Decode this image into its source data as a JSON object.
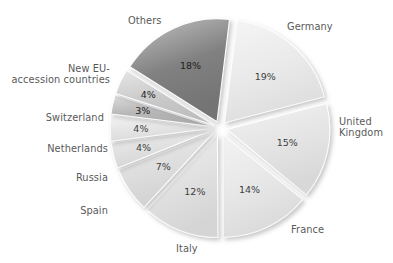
{
  "chart_data": {
    "type": "pie",
    "title": "",
    "xlabel": "",
    "ylabel": "",
    "units": "percent",
    "legend_position": "callout-labels",
    "grid": false,
    "exploded": true,
    "start_angle_deg": -83,
    "categories": [
      "Germany",
      "United Kingdom",
      "France",
      "Italy",
      "Spain",
      "Russia",
      "Netherlands",
      "Switzerland",
      "New EU-accession countries",
      "Others"
    ],
    "values": [
      19,
      15,
      14,
      12,
      7,
      4,
      4,
      3,
      4,
      18
    ],
    "value_labels": [
      "19%",
      "15%",
      "14%",
      "12%",
      "7%",
      "4%",
      "4%",
      "3%",
      "4%",
      "18%"
    ],
    "slice_colors": [
      "#e9e9e9",
      "#e3e3e3",
      "#e6e6e6",
      "#e0e0e0",
      "#dcdcdc",
      "#dfdfdf",
      "#e4e4e4",
      "#b5b5b5",
      "#c8c8c8",
      "#7a7a7a"
    ]
  },
  "slices": [
    {
      "id": "germany",
      "name": "Germany",
      "label_lines": [
        "Germany"
      ],
      "value_label": "19%",
      "value": 19,
      "color": "#e9e9e9",
      "dark_text": false,
      "label_pos": {
        "left": 287,
        "top": 21,
        "align": "left"
      }
    },
    {
      "id": "united-kingdom",
      "name": "United Kingdom",
      "label_lines": [
        "United",
        "Kingdom"
      ],
      "value_label": "15%",
      "value": 15,
      "color": "#e3e3e3",
      "dark_text": false,
      "label_pos": {
        "left": 339,
        "top": 116,
        "align": "left"
      }
    },
    {
      "id": "france",
      "name": "France",
      "label_lines": [
        "France"
      ],
      "value_label": "14%",
      "value": 14,
      "color": "#e6e6e6",
      "dark_text": false,
      "label_pos": {
        "left": 291,
        "top": 224,
        "align": "left"
      }
    },
    {
      "id": "italy",
      "name": "Italy",
      "label_lines": [
        "Italy"
      ],
      "value_label": "12%",
      "value": 12,
      "color": "#e0e0e0",
      "dark_text": false,
      "label_pos": {
        "left": 176,
        "top": 243,
        "align": "left"
      }
    },
    {
      "id": "spain",
      "name": "Spain",
      "label_lines": [
        "Spain"
      ],
      "value_label": "7%",
      "value": 7,
      "color": "#dcdcdc",
      "dark_text": false,
      "label_pos": {
        "left": 66,
        "top": 205,
        "align": "right",
        "width": 42
      }
    },
    {
      "id": "russia",
      "name": "Russia",
      "label_lines": [
        "Russia"
      ],
      "value_label": "4%",
      "value": 4,
      "color": "#dfdfdf",
      "dark_text": false,
      "label_pos": {
        "left": 56,
        "top": 172,
        "align": "right",
        "width": 52
      }
    },
    {
      "id": "netherlands",
      "name": "Netherlands",
      "label_lines": [
        "Netherlands"
      ],
      "value_label": "4%",
      "value": 4,
      "color": "#e4e4e4",
      "dark_text": false,
      "label_pos": {
        "left": 38,
        "top": 143,
        "align": "right",
        "width": 70
      }
    },
    {
      "id": "switzerland",
      "name": "Switzerland",
      "label_lines": [
        "Switzerland"
      ],
      "value_label": "3%",
      "value": 3,
      "color": "#b5b5b5",
      "dark_text": true,
      "label_pos": {
        "left": 38,
        "top": 112,
        "align": "right",
        "width": 66
      }
    },
    {
      "id": "new-eu-accession-countries",
      "name": "New EU-accession countries",
      "label_lines": [
        "New EU-",
        "accession countries"
      ],
      "value_label": "4%",
      "value": 4,
      "color": "#c8c8c8",
      "dark_text": true,
      "label_pos": {
        "left": 2,
        "top": 63,
        "align": "right",
        "width": 108
      }
    },
    {
      "id": "others",
      "name": "Others",
      "label_lines": [
        "Others"
      ],
      "value_label": "18%",
      "value": 18,
      "color": "#7a7a7a",
      "dark_text": true,
      "label_pos": {
        "left": 128,
        "top": 15,
        "align": "left"
      }
    }
  ],
  "geometry": {
    "cx": 220,
    "cy": 128,
    "radius": 103,
    "explode": 7,
    "start_angle_deg": -83
  }
}
